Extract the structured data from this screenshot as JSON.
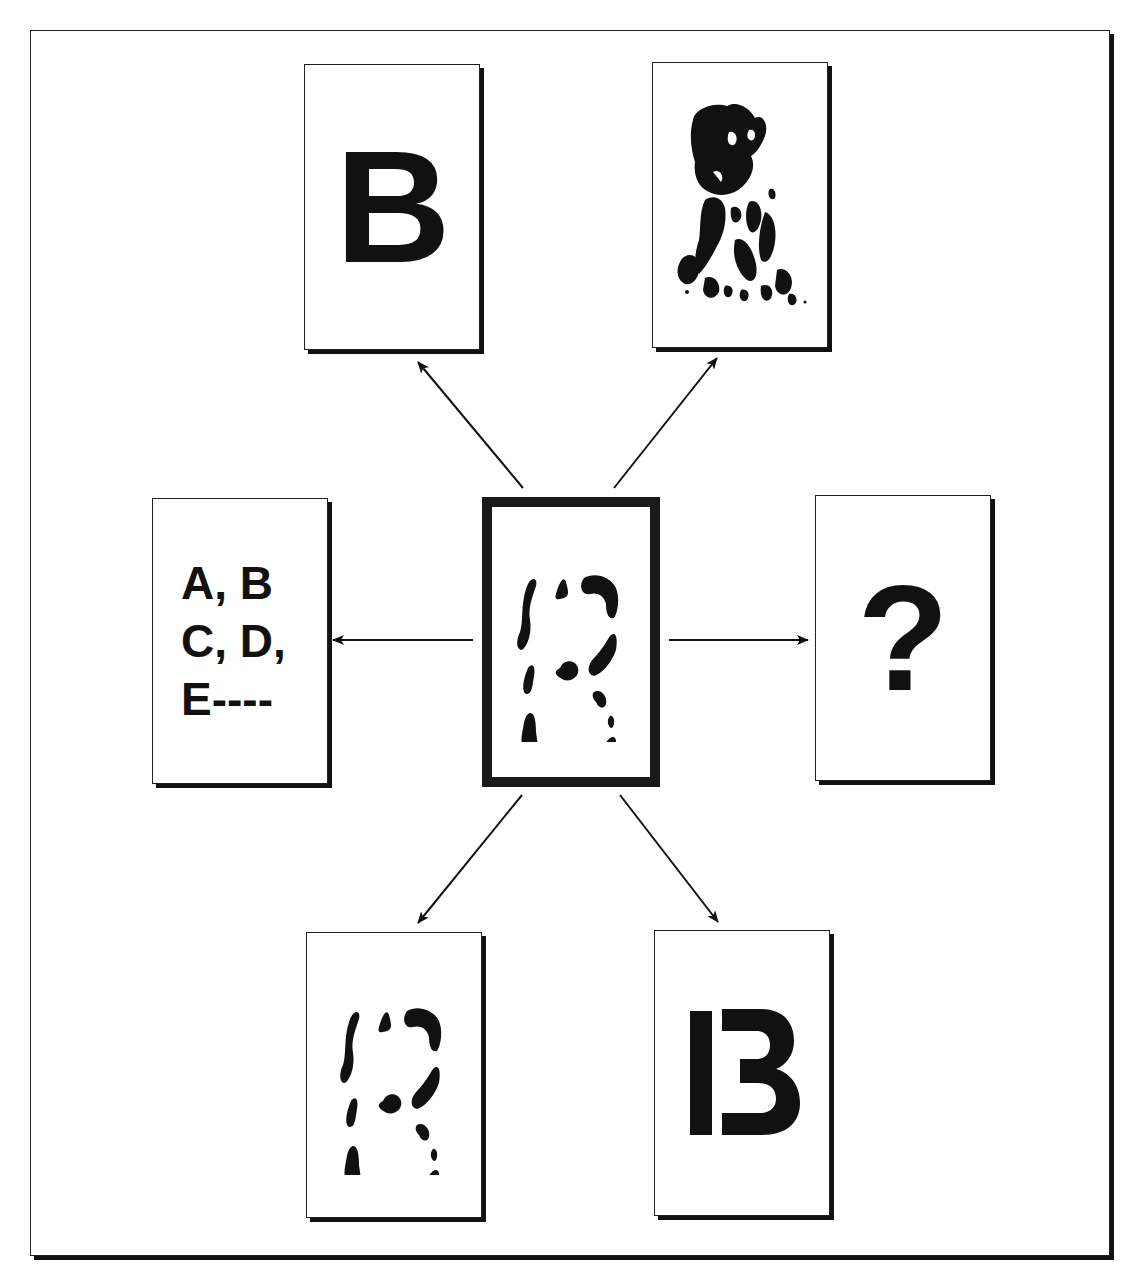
{
  "diagram": {
    "center": {
      "label": "fragmented-B-figure",
      "description": "Degraded, fragmented letter B (ambiguous stimulus)"
    },
    "top_left": {
      "label": "B",
      "description": "Bold complete letter B"
    },
    "top_right": {
      "label": "dalmatian-image",
      "description": "High-contrast fragmented dog image"
    },
    "left": {
      "lines": [
        "A, B",
        "C, D,",
        "E----"
      ],
      "description": "Alphabet sequence context"
    },
    "right": {
      "label": "?",
      "description": "Question mark"
    },
    "bottom_left": {
      "label": "fragmented-B-copy",
      "description": "Same fragmented B figure"
    },
    "bottom_right": {
      "label": "B",
      "description": "Letter B split into bar and 3-shape",
      "bar_part": "I",
      "curve_part": "3"
    },
    "arrows": [
      {
        "from": "center",
        "to": "top_left"
      },
      {
        "from": "center",
        "to": "top_right"
      },
      {
        "from": "center",
        "to": "left"
      },
      {
        "from": "center",
        "to": "right"
      },
      {
        "from": "center",
        "to": "bottom_left"
      },
      {
        "from": "center",
        "to": "bottom_right"
      }
    ],
    "colors": {
      "ink": "#111111",
      "background": "#ffffff"
    }
  }
}
